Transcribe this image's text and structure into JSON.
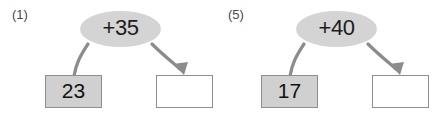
{
  "worksheet": {
    "background_color": "#ffffff",
    "accent_gray": "#d0d0d0",
    "stroke_gray": "#8e8e8e",
    "text_color": "#111111"
  },
  "problems": [
    {
      "index_label": "(1)",
      "operation_label": "+35",
      "start_value": "23",
      "result_value": "",
      "start_box_filled": true,
      "result_box_filled": false
    },
    {
      "index_label": "(5)",
      "operation_label": "+40",
      "start_value": "17",
      "result_value": "",
      "start_box_filled": true,
      "result_box_filled": false
    }
  ]
}
